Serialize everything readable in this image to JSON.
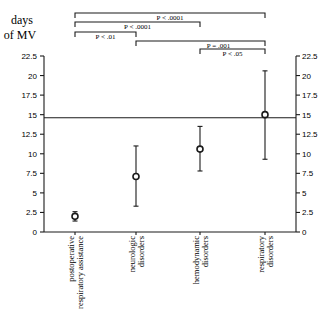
{
  "chart_data": {
    "type": "scatter",
    "subtype": "mean with error bars",
    "title": "",
    "ylabel": "days of MV",
    "ylabel_lines": [
      "days",
      "of MV"
    ],
    "ylim": [
      0,
      22.5
    ],
    "yticks": [
      0,
      2.5,
      5,
      7.5,
      10,
      12.5,
      15,
      17.5,
      20,
      22.5
    ],
    "ytick_labels": [
      "0",
      "2.5",
      "5",
      "7.5",
      "10",
      "12.5",
      "15",
      "17.5",
      "20",
      "22.5"
    ],
    "secondary_y_axis": true,
    "grid": false,
    "categories": [
      "postoperative respiratory assistance",
      "neurologic disorders",
      "hemodynamic disorders",
      "respiratory disorders"
    ],
    "category_label_lines": [
      [
        "postoperative",
        "respiratory assistance"
      ],
      [
        "neurologic",
        "disorders"
      ],
      [
        "hemodynamic",
        "disorders"
      ],
      [
        "respiratory",
        "disorders"
      ]
    ],
    "series": [
      {
        "name": "days of MV",
        "values": [
          2.0,
          7.1,
          10.6,
          15.0
        ],
        "lower": [
          1.4,
          3.3,
          7.8,
          9.3
        ],
        "upper": [
          2.6,
          11.0,
          13.5,
          20.6
        ]
      }
    ],
    "reference_line": {
      "y": 14.6
    },
    "significance_brackets": [
      {
        "from": 0,
        "to": 3,
        "label": "P < .0001"
      },
      {
        "from": 0,
        "to": 2,
        "label": "P < .0001"
      },
      {
        "from": 0,
        "to": 1,
        "label": "P < .01"
      },
      {
        "from": 1,
        "to": 3,
        "label": "P = .001"
      },
      {
        "from": 2,
        "to": 3,
        "label": "P < .05"
      }
    ]
  }
}
